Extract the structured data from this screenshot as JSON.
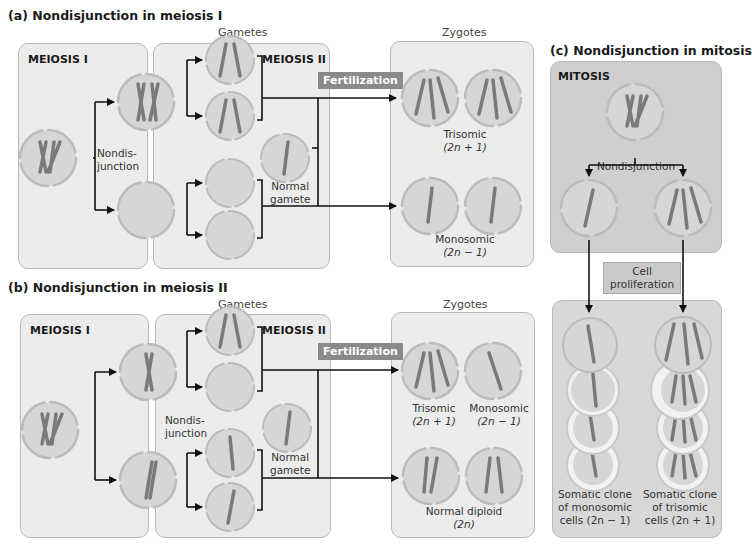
{
  "panel_a": {
    "title": "(a) Nondisjunction in meiosis I",
    "gametes_header": "Gametes",
    "zygotes_header": "Zygotes",
    "meiosis1_label": "MEIOSIS I",
    "meiosis2_label": "MEIOSIS II",
    "nondisjunction_label_1": "Nondis-",
    "nondisjunction_label_2": "junction",
    "normal_gamete_1": "Normal",
    "normal_gamete_2": "gamete",
    "fertilization": "Fertilization",
    "trisomic": "Trisomic",
    "trisomic_formula": "(2n + 1)",
    "monosomic": "Monosomic",
    "monosomic_formula": "(2n − 1)"
  },
  "panel_b": {
    "title": "(b) Nondisjunction in meiosis II",
    "gametes_header": "Gametes",
    "zygotes_header": "Zygotes",
    "meiosis1_label": "MEIOSIS I",
    "meiosis2_label": "MEIOSIS II",
    "nondisjunction_label_1": "Nondis-",
    "nondisjunction_label_2": "junction",
    "normal_gamete_1": "Normal",
    "normal_gamete_2": "gamete",
    "fertilization": "Fertilization",
    "trisomic": "Trisomic",
    "trisomic_formula": "(2n + 1)",
    "monosomic": "Monosomic",
    "monosomic_formula": "(2n − 1)",
    "normal_diploid": "Normal diploid",
    "normal_diploid_formula": "(2n)"
  },
  "panel_c": {
    "title": "(c) Nondisjunction in mitosis",
    "mitosis_label": "MITOSIS",
    "nondisjunction": "Nondisjunction",
    "cell_proliferation_1": "Cell",
    "cell_proliferation_2": "proliferation",
    "mono_clone_1": "Somatic clone",
    "mono_clone_2": "of monosomic",
    "mono_clone_3": "cells (2n − 1)",
    "tri_clone_1": "Somatic clone",
    "tri_clone_2": "of trisomic",
    "tri_clone_3": "cells (2n + 1)"
  },
  "colors": {
    "panel_bg": "#ececec",
    "panel_c_bg": "#cfcfcf",
    "cell_fill": "#d6d6d6",
    "cell_border": "#b8b8b8",
    "chromosome": "#7a7a7a",
    "tag_bg": "#8a8a8a"
  }
}
